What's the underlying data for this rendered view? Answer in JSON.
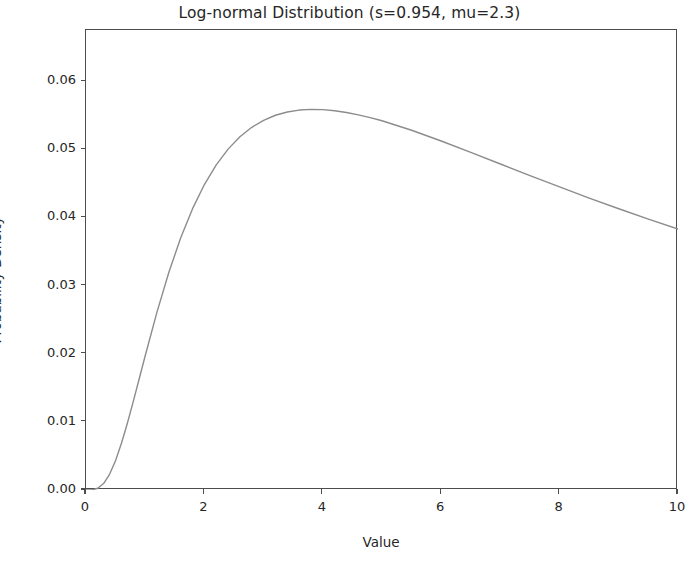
{
  "chart_data": {
    "type": "line",
    "title": "Log-normal Distribution (s=0.954, mu=2.3)",
    "xlabel": "Value",
    "ylabel": "Probability Density",
    "xlim": [
      0,
      10
    ],
    "ylim": [
      0.0,
      0.0675
    ],
    "grid": false,
    "legend": null,
    "xticks": [
      0,
      2,
      4,
      6,
      8,
      10
    ],
    "xtick_labels": [
      "0",
      "2",
      "4",
      "6",
      "8",
      "10"
    ],
    "yticks": [
      0.0,
      0.01,
      0.02,
      0.03,
      0.04,
      0.05,
      0.06
    ],
    "ytick_labels": [
      "0.00",
      "0.01",
      "0.02",
      "0.03",
      "0.04",
      "0.05",
      "0.06"
    ],
    "line_color": "#8c8c8c",
    "line_width": 1.4,
    "parameters": {
      "s": 0.954,
      "mu": 2.3
    },
    "peak": {
      "x": 4.07,
      "y": 0.0657
    },
    "series": [
      {
        "name": "lognorm pdf",
        "x": [
          0.0,
          0.1,
          0.2,
          0.3,
          0.4,
          0.5,
          0.6,
          0.7,
          0.8,
          0.9,
          1.0,
          1.2,
          1.4,
          1.6,
          1.8,
          2.0,
          2.2,
          2.4,
          2.6,
          2.8,
          3.0,
          3.2,
          3.4,
          3.6,
          3.8,
          4.0,
          4.2,
          4.4,
          4.6,
          4.8,
          5.0,
          5.5,
          6.0,
          6.5,
          7.0,
          7.5,
          8.0,
          8.5,
          9.0,
          9.5,
          10.0
        ],
        "y": [
          0.0,
          2e-05,
          0.00026,
          0.00098,
          0.00234,
          0.00434,
          0.00689,
          0.00984,
          0.01304,
          0.01636,
          0.0197,
          0.02614,
          0.03195,
          0.037,
          0.04128,
          0.04482,
          0.04771,
          0.05002,
          0.05183,
          0.05322,
          0.05425,
          0.05499,
          0.05547,
          0.05575,
          0.05585,
          0.05581,
          0.05565,
          0.05539,
          0.05505,
          0.05464,
          0.05418,
          0.05279,
          0.05121,
          0.04954,
          0.04784,
          0.04614,
          0.04447,
          0.04284,
          0.04127,
          0.03975,
          0.0383
        ]
      }
    ]
  }
}
